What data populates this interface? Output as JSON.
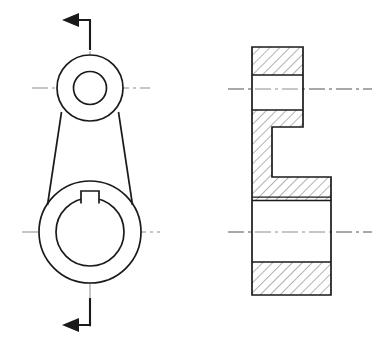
{
  "document": {
    "title": "Mechanical Part — Two-View Engineering Drawing",
    "sheet_width": 376,
    "sheet_height": 349,
    "background_color": "#ffffff",
    "line_color": "#1a1a1a",
    "centerline_color": "#8c8c8c",
    "hatch_color": "#555555",
    "projection": "third-angle",
    "view_count": 2
  },
  "views": {
    "front": {
      "name": "front-elevation-view",
      "label": "Front View (crank arm outline)",
      "upper_boss": {
        "name": "upper-boss",
        "center_x": 90,
        "center_y": 88,
        "outer_radius": 33,
        "inner_radius": 16.5
      },
      "lower_boss": {
        "name": "lower-boss",
        "center_x": 90,
        "center_y": 232,
        "outer_radius": 51,
        "inner_radius": 34
      },
      "web": {
        "name": "tapered-web",
        "top_left_x": 63,
        "top_right_x": 117,
        "top_y": 118,
        "bottom_left_x": 50,
        "bottom_right_x": 130,
        "bottom_y": 196
      },
      "keyway": {
        "name": "keyway-notch",
        "width": 18,
        "height": 13,
        "top_y": 191,
        "center_x": 90
      },
      "vertical_centerline": {
        "name": "vertical-centerline",
        "x": 90,
        "y_top": 22,
        "y_bottom": 327
      },
      "horizontal_centerlines": [
        {
          "name": "upper-boss-centerline",
          "y": 88,
          "x_start": 32,
          "x_end": 150
        },
        {
          "name": "lower-boss-centerline",
          "y": 232,
          "x_start": 22,
          "x_end": 160
        }
      ]
    },
    "section": {
      "name": "section-view",
      "label": "Section View (cut through axis)",
      "outer_left_x": 252,
      "outer_right_x": 331,
      "upper_right_x": 303,
      "top_y": 47,
      "bottom_y": 295,
      "step_inner_x": 272,
      "step_top_y": 127,
      "step_bottom_y": 177,
      "upper_bore": {
        "name": "upper-bore",
        "top_y": 75,
        "bottom_y": 110,
        "left_x": 252,
        "right_x": 303
      },
      "lower_bore": {
        "name": "lower-bore",
        "top_y": 200,
        "bottom_y": 262,
        "left_x": 252,
        "right_x": 331
      },
      "thin_relief_line_y": 197,
      "horizontal_centerlines": [
        {
          "name": "section-upper-centerline",
          "y": 89,
          "x_start": 228,
          "x_end": 372
        },
        {
          "name": "section-lower-centerline",
          "y": 232,
          "x_start": 228,
          "x_end": 372
        }
      ]
    }
  },
  "section_cut": {
    "name": "cutting-plane-indicator",
    "line_x": 90,
    "top_arrow": {
      "name": "cutting-plane-arrow-top",
      "direction": "left",
      "stem_y": 20,
      "tip_x": 62,
      "tail_x": 90,
      "half_height": 7
    },
    "bottom_arrow": {
      "name": "cutting-plane-arrow-bottom",
      "direction": "left",
      "stem_y": 325,
      "tip_x": 62,
      "tail_x": 90,
      "half_height": 7
    }
  },
  "hatching": {
    "name": "section-hatch",
    "angle_degrees": 45,
    "spacing_px": 7,
    "stroke_width": 0.9,
    "color": "#555555"
  },
  "colors": {
    "line": "#1a1a1a",
    "centerline": "#8c8c8c",
    "hatch": "#555555",
    "background": "#ffffff"
  }
}
